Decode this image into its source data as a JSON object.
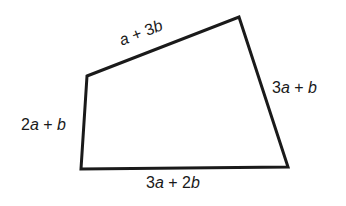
{
  "figure": {
    "type": "quadrilateral",
    "stroke_color": "#1a1a1a",
    "stroke_width": 3,
    "vertices": [
      {
        "name": "top-left",
        "x": 87,
        "y": 76
      },
      {
        "name": "top-right",
        "x": 239,
        "y": 17
      },
      {
        "name": "bottom-right",
        "x": 288,
        "y": 167
      },
      {
        "name": "bottom-left",
        "x": 81,
        "y": 169
      }
    ],
    "sides": {
      "top": "a + 3b",
      "right": "3a + b",
      "bottom": "3a + 2b",
      "left": "2a + b"
    }
  }
}
